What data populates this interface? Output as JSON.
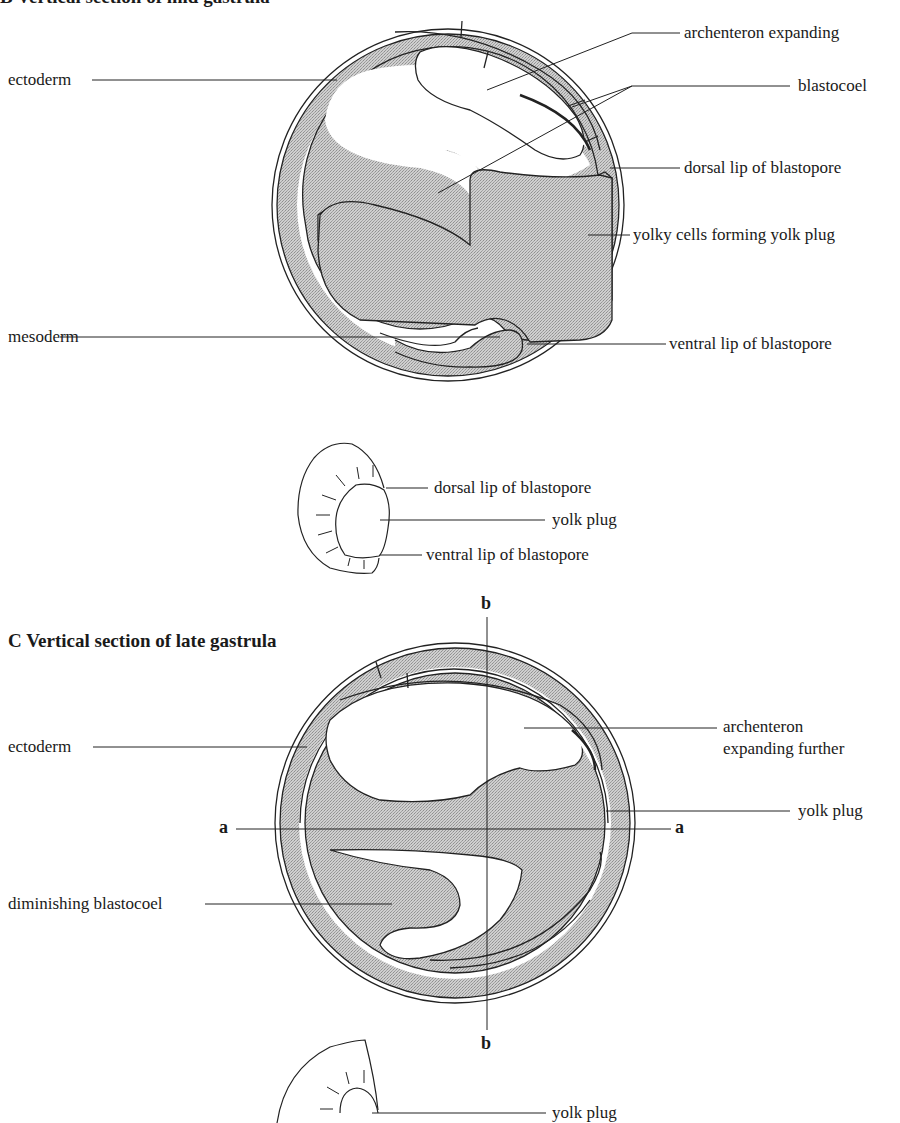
{
  "figure_b": {
    "title_partial": "B Vertical section of mid gastrula",
    "labels": {
      "ectoderm": "ectoderm",
      "archenteron": "archenteron expanding",
      "blastocoel": "blastocoel",
      "dorsal_lip": "dorsal lip of blastopore",
      "yolk_cells": "yolky cells forming yolk plug",
      "mesoderm": "mesoderm",
      "ventral_lip": "ventral lip of blastopore"
    },
    "external_view": {
      "dorsal_lip": "dorsal lip of blastopore",
      "yolk_plug": "yolk plug",
      "ventral_lip": "ventral lip of blastopore"
    }
  },
  "figure_c": {
    "title": "C Vertical section of late gastrula",
    "labels": {
      "ectoderm": "ectoderm",
      "archenteron_line1": "archenteron",
      "archenteron_line2": "expanding further",
      "yolk_plug": "yolk plug",
      "blastocoel": "diminishing blastocoel"
    },
    "axes": {
      "a_left": "a",
      "a_right": "a",
      "b_top": "b",
      "b_bottom": "b"
    },
    "external_view": {
      "yolk_plug": "yolk plug"
    }
  },
  "colors": {
    "stipple_fill": "#c4c4c4",
    "line": "#222222",
    "background": "#ffffff"
  }
}
